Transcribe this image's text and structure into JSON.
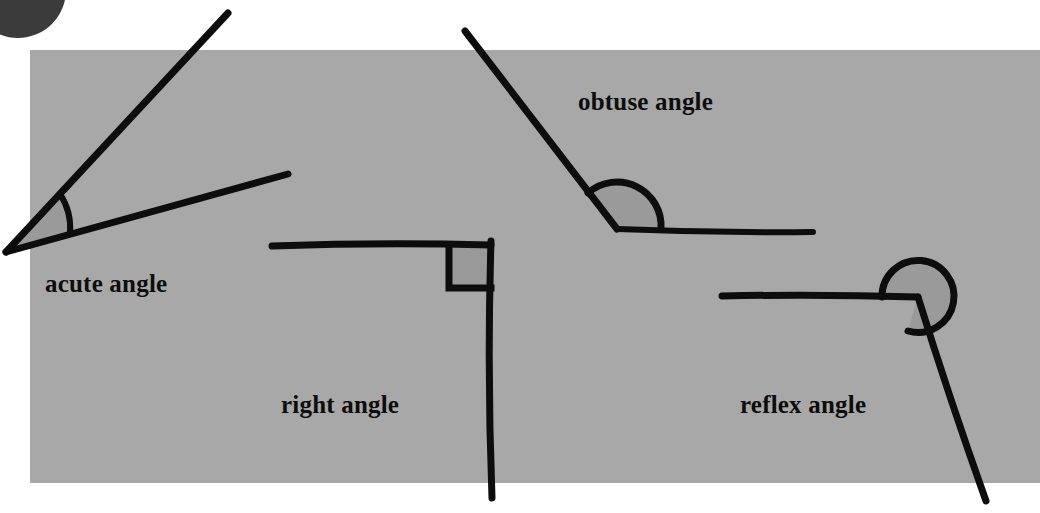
{
  "figure": {
    "canvas": {
      "width": 1040,
      "height": 513
    },
    "colors": {
      "page_background": "#ffffff",
      "panel_background": "#a8a8a8",
      "ink": "#0d0d0d",
      "arc_fill": "#9a9a9a",
      "corner_disc": "#3b3b3b",
      "label_text": "#0d0d0d"
    },
    "panel": {
      "x": 30,
      "y": 50,
      "width": 1010,
      "height": 433
    },
    "corner_disc": {
      "cx": 18,
      "cy": -10,
      "r": 48
    }
  },
  "diagrams": [
    {
      "id": "acute",
      "label": "acute angle",
      "label_x": 45,
      "label_y": 292,
      "vertex": {
        "x": 6,
        "y": 252
      },
      "ray_a_end": {
        "x": 228,
        "y": 13
      },
      "ray_b_end": {
        "x": 288,
        "y": 174
      },
      "marker": "filled-arc",
      "arc_radius": 62,
      "stroke_width": 6
    },
    {
      "id": "right",
      "label": "right angle",
      "label_x": 281,
      "label_y": 413,
      "vertex": {
        "x": 491,
        "y": 245
      },
      "ray_a_end": {
        "x": 272,
        "y": 246
      },
      "ray_b_end": {
        "x": 492,
        "y": 498
      },
      "marker": "square",
      "square_size": 42,
      "stroke_width": 6
    },
    {
      "id": "obtuse",
      "label": "obtuse angle",
      "label_x": 578,
      "label_y": 110,
      "vertex": {
        "x": 617,
        "y": 229
      },
      "ray_a_end": {
        "x": 465,
        "y": 31
      },
      "ray_b_end": {
        "x": 813,
        "y": 232
      },
      "marker": "filled-arc",
      "arc_radius": 38,
      "stroke_width": 6
    },
    {
      "id": "reflex",
      "label": "reflex angle",
      "label_x": 740,
      "label_y": 413,
      "vertex": {
        "x": 918,
        "y": 297
      },
      "ray_a_end": {
        "x": 722,
        "y": 296
      },
      "ray_b_end": {
        "x": 986,
        "y": 501
      },
      "marker": "filled-reflex-arc",
      "arc_radius": 36,
      "stroke_width": 6
    }
  ]
}
